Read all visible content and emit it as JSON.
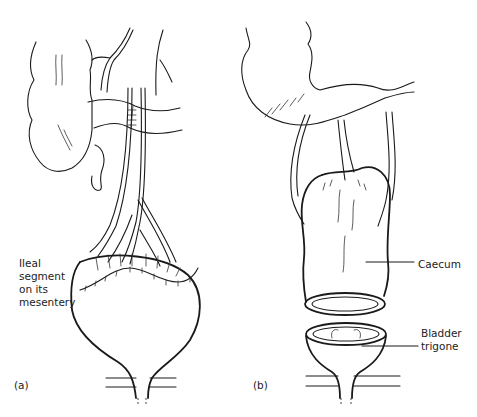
{
  "figure": {
    "panels": [
      {
        "id": "a",
        "label": "(a)",
        "annotations": [
          {
            "text_lines": [
              "Ileal",
              "segment",
              "on its",
              "mesentery"
            ]
          }
        ]
      },
      {
        "id": "b",
        "label": "(b)",
        "annotations": [
          {
            "text_lines": [
              "Caecum"
            ]
          },
          {
            "text_lines": [
              "Bladder",
              "trigone"
            ]
          }
        ]
      }
    ]
  },
  "labels": {
    "panel_a": "(a)",
    "panel_b": "(b)",
    "ileal_1": "Ileal",
    "ileal_2": "segment",
    "ileal_3": "on its",
    "ileal_4": "mesentery",
    "caecum": "Caecum",
    "bladder_1": "Bladder",
    "bladder_2": "trigone"
  },
  "colors": {
    "line": "#1a1a1a",
    "background": "#ffffff"
  }
}
